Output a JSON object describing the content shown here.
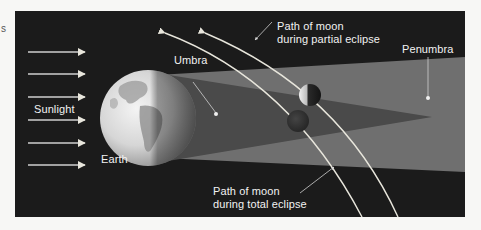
{
  "figure": {
    "type": "lunar-eclipse-diagram",
    "colors": {
      "page_background": "#f7f7f5",
      "space": "#1b1b1b",
      "penumbra": "#6f6f6f",
      "umbra": "#4a4a4a",
      "label_text": "#f2f2f2",
      "path_line": "#e8e6dc"
    },
    "edge_fragment": "s",
    "labels": {
      "sunlight": "Sunlight",
      "earth": "Earth",
      "umbra": "Umbra",
      "penumbra": "Penumbra",
      "partial_path_line1": "Path of moon",
      "partial_path_line2": "during partial eclipse",
      "total_path_line1": "Path of moon",
      "total_path_line2": "during total eclipse"
    },
    "sunlight_arrows": [
      {
        "y": 52
      },
      {
        "y": 74
      },
      {
        "y": 97
      },
      {
        "y": 120
      },
      {
        "y": 143
      },
      {
        "y": 165
      }
    ],
    "icons": {
      "earth": "earth-globe-icon",
      "moon_partial": "moon-partial-icon",
      "moon_total": "moon-total-icon",
      "arrow": "arrow-right-icon"
    }
  }
}
